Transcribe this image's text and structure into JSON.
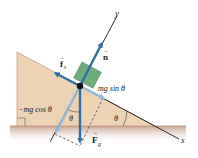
{
  "diagram": {
    "type": "free-body diagram on inclined plane",
    "axes": {
      "x_label": "x",
      "y_label": "y"
    },
    "forces": {
      "normal": {
        "symbol": "n",
        "label": "n"
      },
      "static_friction": {
        "symbol": "f",
        "subscript": "s"
      },
      "gravity": {
        "symbol": "F",
        "subscript": "g"
      },
      "parallel_component": {
        "label": "mg sin θ"
      },
      "perpendicular_component": {
        "label": "−mg cos θ"
      }
    },
    "angles": {
      "incline_angle": "θ",
      "component_angle": "θ"
    },
    "colors": {
      "wedge": "#edd2b4",
      "ground": "#d9b8a8",
      "block": "#6fae7a",
      "arrow_dark": "#2f6fa8",
      "arrow_light": "#8fb8da",
      "axis": "#1a1a1a"
    }
  }
}
